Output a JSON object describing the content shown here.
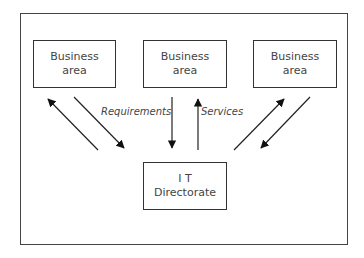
{
  "diagram": {
    "nodes": [
      {
        "id": "business-area-left",
        "line1": "Business",
        "line2": "area"
      },
      {
        "id": "business-area-middle",
        "line1": "Business",
        "line2": "area"
      },
      {
        "id": "business-area-right",
        "line1": "Business",
        "line2": "area"
      },
      {
        "id": "it-directorate",
        "line1": "I T",
        "line2": "Directorate"
      }
    ],
    "edges": [
      {
        "from": "it-directorate",
        "to": "business-area-left"
      },
      {
        "from": "business-area-left",
        "to": "it-directorate"
      },
      {
        "from": "business-area-middle",
        "to": "it-directorate",
        "label": "Requirements"
      },
      {
        "from": "it-directorate",
        "to": "business-area-middle",
        "label": "Services"
      },
      {
        "from": "it-directorate",
        "to": "business-area-right"
      },
      {
        "from": "business-area-right",
        "to": "it-directorate"
      }
    ],
    "labels": {
      "requirements": "Requirements",
      "services": "Services"
    }
  }
}
